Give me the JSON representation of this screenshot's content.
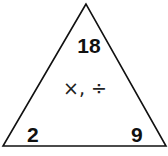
{
  "triangle": {
    "top_value": "18",
    "bottom_left_value": "2",
    "bottom_right_value": "9",
    "operations": "×, ÷"
  }
}
